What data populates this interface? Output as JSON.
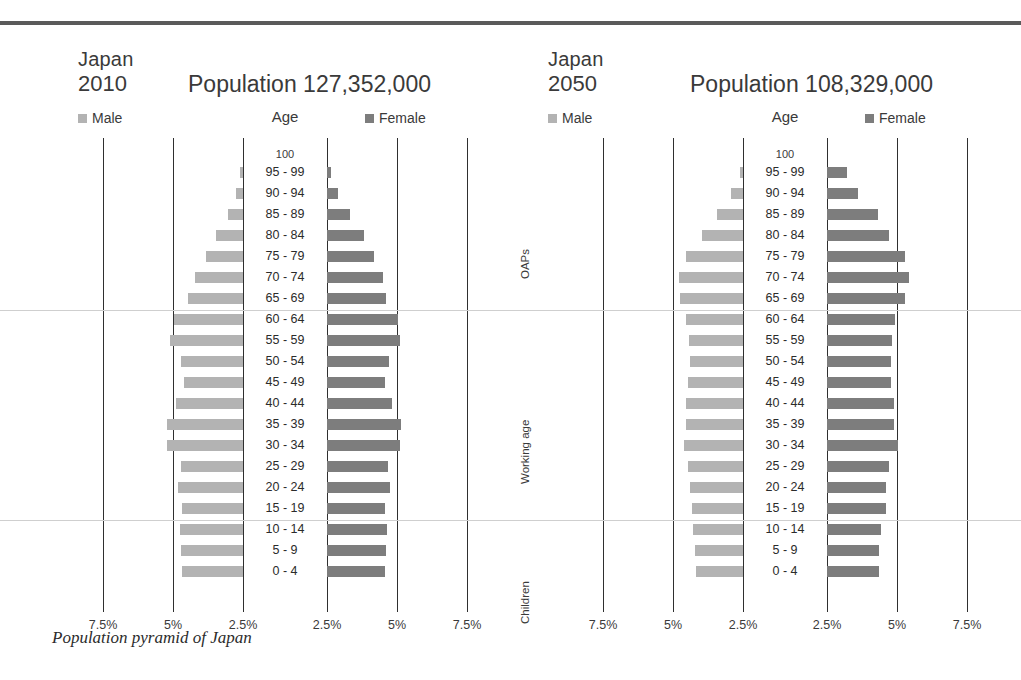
{
  "figure": {
    "caption": "Population pyramid of Japan",
    "age_header": "Age",
    "top_age_label": "100",
    "legend": {
      "male": "Male",
      "female": "Female"
    },
    "colors": {
      "male": "#b3b3b3",
      "female": "#7d7d7d",
      "gridline": "#2f2f2f",
      "separator": "#cfcfcf",
      "rule": "#5a5a5a"
    },
    "category_labels": [
      "OAPs",
      "Working age",
      "Children"
    ],
    "axis_ticks_left": [
      "7.5%",
      "5%",
      "2.5%"
    ],
    "axis_ticks_right": [
      "2.5%",
      "5%",
      "7.5%"
    ]
  },
  "chart_data": {
    "type": "bar",
    "subtype": "population-pyramid",
    "title": "Population pyramid of Japan",
    "xlabel": "Percent of total population",
    "ylabel": "Age",
    "xlim": [
      -8.75,
      8.75
    ],
    "xticks": [
      -7.5,
      -5,
      -2.5,
      2.5,
      5,
      7.5
    ],
    "xtick_labels": [
      "7.5%",
      "5%",
      "2.5%",
      "2.5%",
      "5%",
      "7.5%"
    ],
    "grid": true,
    "legend_position": "top",
    "categories": [
      "95 - 99",
      "90 - 94",
      "85 - 89",
      "80 - 84",
      "75 - 79",
      "70 - 74",
      "65 - 69",
      "60 - 64",
      "55 - 59",
      "50 - 54",
      "45 - 49",
      "40 - 44",
      "35 - 39",
      "30 - 34",
      "25 - 29",
      "20 - 24",
      "15 - 19",
      "10 - 14",
      "5 - 9",
      "0 - 4"
    ],
    "group_bands": [
      {
        "label": "OAPs",
        "from": "65 - 69",
        "to": "100"
      },
      {
        "label": "Working age",
        "from": "15 - 19",
        "to": "60 - 64"
      },
      {
        "label": "Children",
        "from": "0 - 4",
        "to": "10 - 14"
      }
    ],
    "panels": [
      {
        "country": "Japan",
        "year": "2010",
        "population_label": "Population",
        "population": "127,352,000",
        "series": [
          {
            "name": "Male",
            "values": [
              0.1,
              0.24,
              0.52,
              0.95,
              1.32,
              1.72,
              1.95,
              2.45,
              2.62,
              2.23,
              2.1,
              2.38,
              2.72,
              2.7,
              2.23,
              2.33,
              2.17,
              2.25,
              2.23,
              2.17
            ]
          },
          {
            "name": "Female",
            "values": [
              0.13,
              0.4,
              0.82,
              1.32,
              1.68,
              2.0,
              2.12,
              2.52,
              2.6,
              2.2,
              2.07,
              2.32,
              2.65,
              2.62,
              2.17,
              2.25,
              2.07,
              2.13,
              2.12,
              2.07
            ]
          }
        ]
      },
      {
        "country": "Japan",
        "year": "2050",
        "population_label": "Population",
        "population": "108,329,000",
        "series": [
          {
            "name": "Male",
            "values": [
              0.1,
              0.42,
              0.92,
              1.45,
              2.05,
              2.3,
              2.25,
              2.05,
              1.92,
              1.9,
              1.95,
              2.02,
              2.05,
              2.12,
              1.98,
              1.88,
              1.82,
              1.78,
              1.7,
              1.67
            ]
          },
          {
            "name": "Female",
            "values": [
              0.72,
              1.1,
              1.82,
              2.22,
              2.78,
              2.92,
              2.78,
              2.42,
              2.32,
              2.28,
              2.3,
              2.38,
              2.4,
              2.52,
              2.22,
              2.12,
              2.1,
              1.92,
              1.85,
              1.85
            ]
          }
        ]
      }
    ]
  }
}
